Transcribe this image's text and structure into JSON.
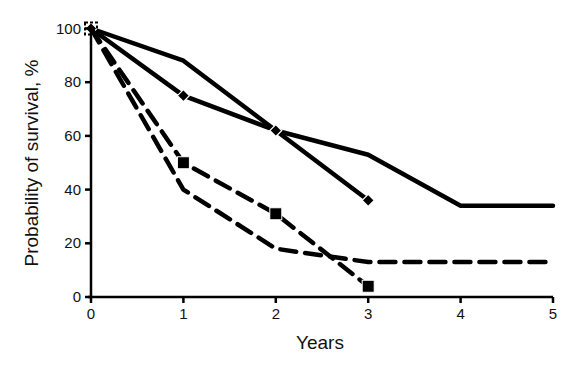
{
  "chart_data": {
    "type": "line",
    "title": "",
    "xlabel": "Years",
    "ylabel": "Probability of survival, %",
    "xlim": [
      0,
      5
    ],
    "ylim": [
      0,
      100
    ],
    "x_ticks": [
      0,
      1,
      2,
      3,
      4,
      5
    ],
    "y_ticks": [
      0,
      20,
      40,
      60,
      80,
      100
    ],
    "grid": false,
    "legend": null,
    "series": [
      {
        "name": "Series A (solid, no markers)",
        "style": "solid",
        "marker": "none",
        "x": [
          0,
          1,
          2,
          3,
          4,
          5
        ],
        "values": [
          100,
          88,
          62,
          53,
          34,
          34
        ]
      },
      {
        "name": "Series B (solid, diamond markers)",
        "style": "solid",
        "marker": "diamond",
        "x": [
          0,
          1,
          2,
          3
        ],
        "values": [
          100,
          75,
          62,
          36
        ]
      },
      {
        "name": "Series C (dashed, square markers)",
        "style": "dashed",
        "marker": "square",
        "x": [
          0,
          1,
          2,
          3
        ],
        "values": [
          100,
          50,
          31,
          4
        ]
      },
      {
        "name": "Series D (dashed, no markers)",
        "style": "dashed",
        "marker": "none",
        "x": [
          0,
          1,
          2,
          3,
          4,
          5
        ],
        "values": [
          100,
          40,
          18,
          13,
          13,
          13
        ]
      }
    ]
  },
  "axes": {
    "x_title": "Years",
    "y_title": "Probability of survival, %",
    "x_tick_labels": [
      "0",
      "1",
      "2",
      "3",
      "4",
      "5"
    ],
    "y_tick_labels": [
      "0",
      "20",
      "40",
      "60",
      "80",
      "100"
    ]
  },
  "colors": {
    "line": "#000000",
    "background": "#ffffff",
    "text": "#111111"
  }
}
